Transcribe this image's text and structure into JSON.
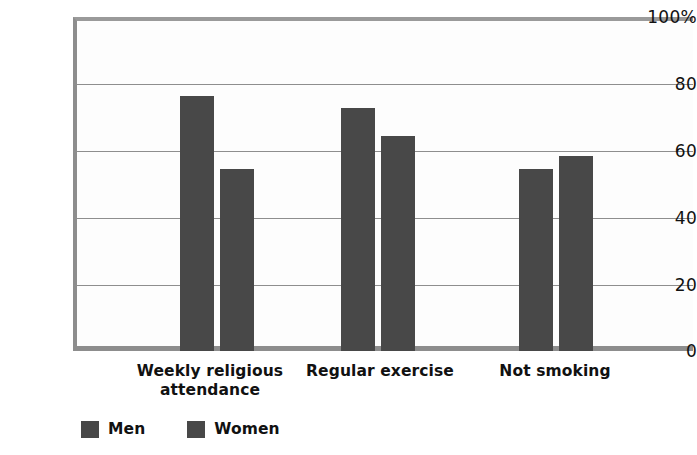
{
  "chart_data": {
    "type": "bar",
    "title": "",
    "subtitle": "",
    "xlabel": "",
    "ylabel": "",
    "ylim": [
      0,
      100
    ],
    "yticks": [
      "0",
      "20",
      "40",
      "60",
      "80",
      "100%"
    ],
    "ytick_values": [
      0,
      20,
      40,
      60,
      80,
      100
    ],
    "grid": true,
    "legend_position": "bottom-left",
    "categories": [
      "Weekly religious attendance",
      "Regular exercise",
      "Not smoking"
    ],
    "category_lines": [
      [
        "Weekly religious",
        "attendance"
      ],
      [
        "Regular exercise"
      ],
      [
        "Not smoking"
      ]
    ],
    "series": [
      {
        "name": "Men",
        "color": "#484848",
        "values": [
          76.5,
          73,
          54.5
        ]
      },
      {
        "name": "Women",
        "color": "#484848",
        "values": [
          54.5,
          64.5,
          58.5
        ]
      }
    ]
  },
  "legend": {
    "items": [
      {
        "label": "Men"
      },
      {
        "label": "Women"
      }
    ]
  },
  "axis": {
    "y_labels": [
      "100%",
      "80",
      "60",
      "40",
      "20",
      "0"
    ]
  }
}
